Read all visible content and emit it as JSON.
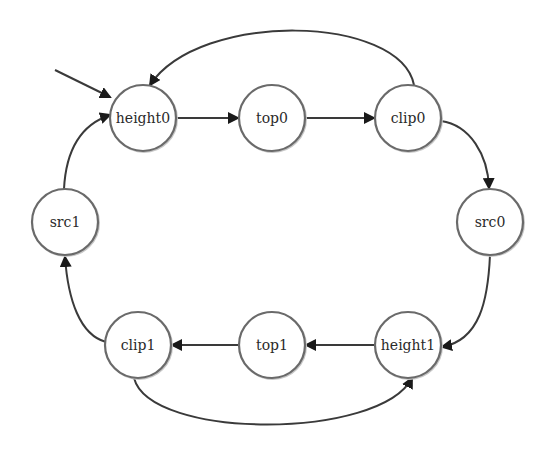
{
  "diagram": {
    "type": "state-machine",
    "colors": {
      "background": "#ffffff",
      "node_fill": "#ffffff",
      "node_stroke": "#6a6a6a",
      "edge": "#3a3a3a",
      "text": "#2a2a2a"
    },
    "start_state": "height0",
    "nodes": [
      {
        "id": "height0",
        "label": "height0",
        "x": 143,
        "y": 118
      },
      {
        "id": "top0",
        "label": "top0",
        "x": 272,
        "y": 118
      },
      {
        "id": "clip0",
        "label": "clip0",
        "x": 408,
        "y": 118
      },
      {
        "id": "src0",
        "label": "src0",
        "x": 490,
        "y": 222
      },
      {
        "id": "height1",
        "label": "height1",
        "x": 408,
        "y": 345
      },
      {
        "id": "top1",
        "label": "top1",
        "x": 272,
        "y": 345
      },
      {
        "id": "clip1",
        "label": "clip1",
        "x": 138,
        "y": 345
      },
      {
        "id": "src1",
        "label": "src1",
        "x": 65,
        "y": 222
      }
    ],
    "edges": [
      {
        "from": "start",
        "to": "height0"
      },
      {
        "from": "height0",
        "to": "top0"
      },
      {
        "from": "top0",
        "to": "clip0"
      },
      {
        "from": "clip0",
        "to": "height0"
      },
      {
        "from": "clip0",
        "to": "src0"
      },
      {
        "from": "src0",
        "to": "height1"
      },
      {
        "from": "height1",
        "to": "top1"
      },
      {
        "from": "top1",
        "to": "clip1"
      },
      {
        "from": "clip1",
        "to": "height1"
      },
      {
        "from": "clip1",
        "to": "src1"
      },
      {
        "from": "src1",
        "to": "height0"
      }
    ]
  }
}
